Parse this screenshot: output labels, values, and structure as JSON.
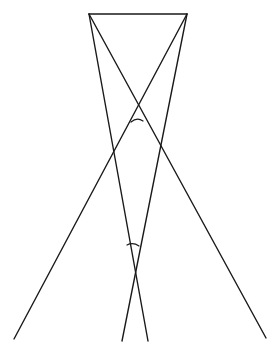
{
  "diagram": {
    "width": 280,
    "height": 351,
    "background": "#ffffff",
    "stroke_color": "#1a1a1a",
    "points": {
      "A": [
        89,
        14
      ],
      "B": [
        187,
        14
      ]
    },
    "segments": [
      {
        "name": "top-segment-AB",
        "x1": 89,
        "y1": 14,
        "x2": 187,
        "y2": 14
      },
      {
        "name": "line-from-A-to-lower-center",
        "x1": 89,
        "y1": 14,
        "x2": 148,
        "y2": 341
      },
      {
        "name": "line-from-A-to-lower-right",
        "x1": 89,
        "y1": 14,
        "x2": 266,
        "y2": 338
      },
      {
        "name": "line-from-B-to-lower-left",
        "x1": 187,
        "y1": 14,
        "x2": 14,
        "y2": 339
      },
      {
        "name": "line-from-B-to-lower-center",
        "x1": 187,
        "y1": 14,
        "x2": 122,
        "y2": 341
      }
    ],
    "angle_marks": [
      {
        "name": "upper-crossing-angle-arc",
        "d": "M 131 122 Q 137 117 143 121"
      },
      {
        "name": "lower-crossing-angle-arc",
        "d": "M 127 245 Q 133 242 139 246"
      }
    ]
  }
}
